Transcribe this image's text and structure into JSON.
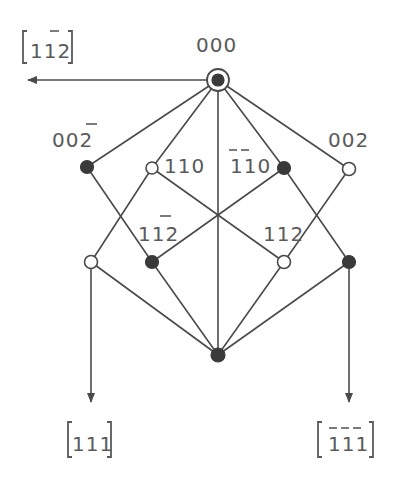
{
  "diagram": {
    "type": "reciprocal-lattice / diffraction pattern schematic",
    "nodes": [
      {
        "id": "000",
        "label": "000",
        "x": 218,
        "y": 80,
        "style": "ring-filled"
      },
      {
        "id": "00-2",
        "label": "002",
        "bars": [
          2
        ],
        "x": 87,
        "y": 167,
        "style": "filled"
      },
      {
        "id": "110",
        "label": "110",
        "bars": [],
        "x": 152,
        "y": 168,
        "style": "open"
      },
      {
        "id": "-1-10",
        "label": "110",
        "bars": [
          0,
          1
        ],
        "x": 284,
        "y": 168,
        "style": "filled"
      },
      {
        "id": "002",
        "label": "002",
        "bars": [],
        "x": 349,
        "y": 169,
        "style": "open"
      },
      {
        "id": "11-2",
        "label": "112",
        "bars": [
          2
        ],
        "x": 152,
        "y": 262,
        "style": "filled"
      },
      {
        "id": "112",
        "label": "112",
        "bars": [],
        "x": 284,
        "y": 262,
        "style": "open"
      },
      {
        "id": "left-open",
        "label": "",
        "x": 91,
        "y": 262,
        "style": "open"
      },
      {
        "id": "right-filled",
        "label": "",
        "x": 349,
        "y": 262,
        "style": "filled"
      },
      {
        "id": "bottom",
        "label": "",
        "x": 218,
        "y": 355,
        "style": "filled"
      }
    ],
    "center_crossing": {
      "x": 218,
      "y": 213
    },
    "directions": [
      {
        "id": "dir-11-2",
        "label": "112",
        "bars": [
          2
        ],
        "from": [
          206,
          80
        ],
        "to": [
          28,
          80
        ]
      },
      {
        "id": "dir-111",
        "label": "111",
        "bars": [],
        "from": [
          91,
          262
        ],
        "to": [
          91,
          400
        ]
      },
      {
        "id": "dir--1-1-1",
        "label": "111",
        "bars": [
          0,
          1,
          2
        ],
        "from": [
          349,
          262
        ],
        "to": [
          349,
          400
        ]
      }
    ],
    "labels": {
      "top": "000",
      "upper_left": "002",
      "upper_left_bar": "2",
      "inner_left": "110",
      "inner_right": "110",
      "upper_right": "002",
      "mid_left": "112",
      "mid_right": "112",
      "arrow_left": "112",
      "bottom_left_dir": "111",
      "bottom_right_dir": "111"
    },
    "colors": {
      "line": "#4a4a4a",
      "filled_node": "#3a3a3a",
      "text": "#5a5a5a",
      "background": "#ffffff"
    }
  }
}
